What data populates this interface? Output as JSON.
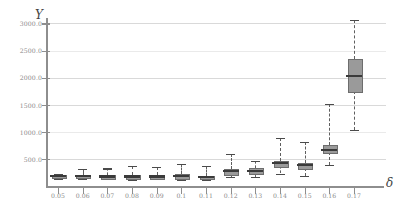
{
  "chart_data": {
    "type": "boxplot",
    "title": "",
    "subtitle": "",
    "xlabel": "δ",
    "ylabel": "Y",
    "grid": true,
    "legend": "none",
    "xlim": [
      0.045,
      0.175
    ],
    "ylim": [
      0.0,
      3100.0
    ],
    "ytick_labels": [
      "500.0",
      "1000.0",
      "1500.0",
      "2000.0",
      "2500.0",
      "3000.0"
    ],
    "ytick_values": [
      500.0,
      1000.0,
      1500.0,
      2000.0,
      2500.0,
      3000.0
    ],
    "xtick_labels": [
      "0.05",
      "0.06",
      "0.07",
      "0.08",
      "0.09",
      "0.1",
      "0.11",
      "0.12",
      "0.13",
      "0.14",
      "0.15",
      "0.16",
      "0.17"
    ],
    "categories": [
      0.05,
      0.06,
      0.07,
      0.08,
      0.09,
      0.1,
      0.11,
      0.12,
      0.13,
      0.14,
      0.15,
      0.16,
      0.17
    ],
    "boxes": [
      {
        "x": "0.05",
        "whisker_low": 130,
        "q1": 160,
        "median": 180,
        "q3": 200,
        "whisker_high": 225
      },
      {
        "x": "0.06",
        "whisker_low": 130,
        "q1": 160,
        "median": 180,
        "q3": 205,
        "whisker_high": 320
      },
      {
        "x": "0.07",
        "whisker_low": 125,
        "q1": 155,
        "median": 175,
        "q3": 200,
        "whisker_high": 325
      },
      {
        "x": "0.08",
        "whisker_low": 120,
        "q1": 155,
        "median": 175,
        "q3": 205,
        "whisker_high": 375
      },
      {
        "x": "0.09",
        "whisker_low": 125,
        "q1": 155,
        "median": 175,
        "q3": 195,
        "whisker_high": 350
      },
      {
        "x": "0.1",
        "whisker_low": 120,
        "q1": 155,
        "median": 180,
        "q3": 215,
        "whisker_high": 405
      },
      {
        "x": "0.11",
        "whisker_low": 110,
        "q1": 145,
        "median": 165,
        "q3": 190,
        "whisker_high": 365
      },
      {
        "x": "0.12",
        "whisker_low": 170,
        "q1": 230,
        "median": 270,
        "q3": 320,
        "whisker_high": 600
      },
      {
        "x": "0.13",
        "whisker_low": 175,
        "q1": 235,
        "median": 280,
        "q3": 330,
        "whisker_high": 470
      },
      {
        "x": "0.14",
        "whisker_low": 230,
        "q1": 370,
        "median": 420,
        "q3": 470,
        "whisker_high": 890
      },
      {
        "x": "0.15",
        "whisker_low": 190,
        "q1": 340,
        "median": 380,
        "q3": 430,
        "whisker_high": 820
      },
      {
        "x": "0.16",
        "whisker_low": 390,
        "q1": 620,
        "median": 670,
        "q3": 760,
        "whisker_high": 1520
      },
      {
        "x": "0.17",
        "whisker_low": 1030,
        "q1": 1760,
        "median": 2030,
        "q3": 2350,
        "whisker_high": 3060
      }
    ],
    "colors": {
      "box_fill": "#9a9a9a",
      "box_edge": "#6d6d6d",
      "median": "#3a3a3a",
      "whisker": "#5f5f5f",
      "grid": "#d9d9d9",
      "axis": "#8e8e8e",
      "tick_text": "#8a8a8a"
    }
  }
}
